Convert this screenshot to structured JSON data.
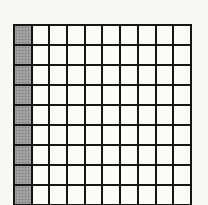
{
  "figure": {
    "type": "hundred-grid",
    "rows": 10,
    "columns": 10,
    "shaded_columns": [
      1
    ],
    "shaded_count": 10,
    "total_cells": 100,
    "colors": {
      "grid_line": "#151515",
      "shaded_fill": "#9a9a9a",
      "empty_fill": "#fbfbfa",
      "background": "#f7f7f5"
    }
  }
}
